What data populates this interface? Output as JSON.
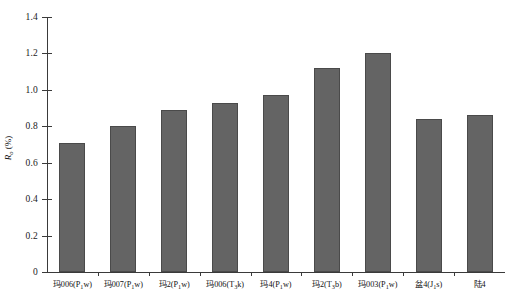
{
  "chart_data": {
    "type": "bar",
    "title": "",
    "xlabel": "",
    "ylabel": "R₀ (%)",
    "ylabel_main": "R",
    "ylabel_sub": "o",
    "ylabel_unit": "(%)",
    "ylim": [
      0,
      1.4
    ],
    "ytick_values": [
      0,
      0.2,
      0.4,
      0.6,
      0.8,
      1.0,
      1.2,
      1.4
    ],
    "ytick_labels": [
      "0",
      "0.2",
      "0.4",
      "0.6",
      "0.8",
      "1.0",
      "1.2",
      "1.4"
    ],
    "grid": false,
    "legend": false,
    "bar_color": "#646464",
    "bar_edge_color": "#4a4a4a",
    "axis_color": "#3a3a3a",
    "categories": [
      "玛006(P₁w)",
      "玛007(P₁w)",
      "玛2(P₁w)",
      "玛006(T₃k)",
      "玛4(P₁w)",
      "玛2(T₃b)",
      "玛003(P₁w)",
      "盆4(J₁s)",
      "陆4"
    ],
    "category_parts": [
      {
        "main": "玛006(P",
        "sub": "1",
        "tail": "w)"
      },
      {
        "main": "玛007(P",
        "sub": "1",
        "tail": "w)"
      },
      {
        "main": "玛2(P",
        "sub": "1",
        "tail": "w)"
      },
      {
        "main": "玛006(T",
        "sub": "3",
        "tail": "k)"
      },
      {
        "main": "玛4(P",
        "sub": "1",
        "tail": "w)"
      },
      {
        "main": "玛2(T",
        "sub": "3",
        "tail": "b)"
      },
      {
        "main": "玛003(P",
        "sub": "1",
        "tail": "w)"
      },
      {
        "main": "盆4(J",
        "sub": "1",
        "tail": "s)"
      },
      {
        "main": "陆4",
        "sub": "",
        "tail": ""
      }
    ],
    "values": [
      0.71,
      0.8,
      0.89,
      0.93,
      0.97,
      1.12,
      1.2,
      0.84,
      0.86
    ]
  }
}
